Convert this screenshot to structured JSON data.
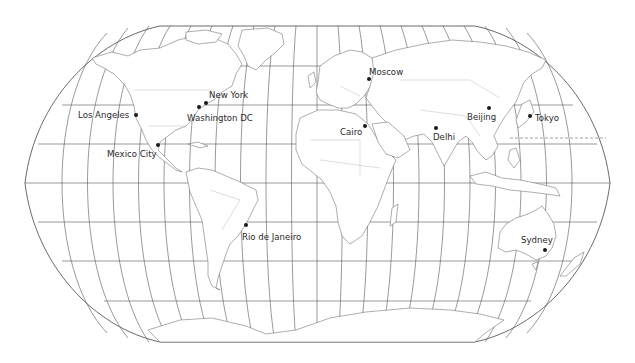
{
  "map": {
    "projection": "Robinson",
    "graticule_latitude_step_deg": 15,
    "graticule_longitude_step_deg": 15,
    "colors": {
      "background": "#ffffff",
      "land_fill": "#ffffff",
      "coastline": "#6a6a6a",
      "borders": "#bdbdbd",
      "graticule": "#555555",
      "city_marker": "#1a1a1a",
      "label_text": "#2a2a2a"
    },
    "dashed_line": "International Date Line segment (east of Japan)"
  },
  "cities": [
    {
      "name": "Los Angeles",
      "x": 136,
      "y": 115
    },
    {
      "name": "New York",
      "x": 206,
      "y": 103
    },
    {
      "name": "Washington DC",
      "x": 199,
      "y": 107
    },
    {
      "name": "Mexico City",
      "x": 158,
      "y": 145
    },
    {
      "name": "Rio de Janeiro",
      "x": 246,
      "y": 225
    },
    {
      "name": "Moscow",
      "x": 369,
      "y": 79
    },
    {
      "name": "Cairo",
      "x": 365,
      "y": 126
    },
    {
      "name": "Delhi",
      "x": 436,
      "y": 128
    },
    {
      "name": "Beijing",
      "x": 489,
      "y": 108
    },
    {
      "name": "Tokyo",
      "x": 530,
      "y": 116
    },
    {
      "name": "Sydney",
      "x": 545,
      "y": 250
    }
  ]
}
